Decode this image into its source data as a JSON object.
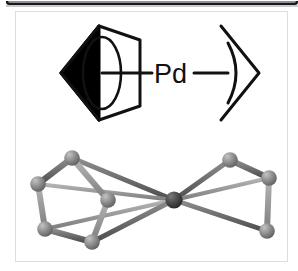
{
  "figure": {
    "caption": "",
    "background_color": "#ffffff",
    "frame_border_color": "#dedede"
  },
  "top_edge": {
    "name": "window-bottom-edge",
    "outer_color": "#17181a",
    "inner_color": "#8d9096",
    "shadow_color": "#c9cbce"
  },
  "scheme_2d": {
    "center_atom_label": "Pd",
    "left_ligand": "cyclopentadienyl-ring",
    "right_ligand": "allyl-group",
    "line_color": "#111111",
    "wedge_color": "#000000"
  },
  "model_3d": {
    "central_atom": "Pd",
    "central_atom_color": "#4a4a4a",
    "ligand_atom_color": "#8a8a8a",
    "bond_color": "#6e6e6e",
    "left_fragment": "cyclopentadienyl-ring",
    "right_fragment": "allyl-group",
    "atoms": [
      {
        "id": "Pd",
        "x": 158,
        "y": 62,
        "r": 7.5,
        "shade": "dark"
      },
      {
        "id": "Cp1",
        "x": 56,
        "y": 20,
        "r": 7.5,
        "shade": "light"
      },
      {
        "id": "Cp2",
        "x": 22,
        "y": 46,
        "r": 7.5,
        "shade": "light"
      },
      {
        "id": "Cp3",
        "x": 29,
        "y": 91,
        "r": 7.5,
        "shade": "light"
      },
      {
        "id": "Cp4",
        "x": 76,
        "y": 104,
        "r": 7.5,
        "shade": "light"
      },
      {
        "id": "Cp5",
        "x": 92,
        "y": 62,
        "r": 7.5,
        "shade": "light"
      },
      {
        "id": "Al1",
        "x": 214,
        "y": 22,
        "r": 7.5,
        "shade": "light"
      },
      {
        "id": "Al2",
        "x": 253,
        "y": 40,
        "r": 7.5,
        "shade": "light"
      },
      {
        "id": "Al3",
        "x": 251,
        "y": 93,
        "r": 7.5,
        "shade": "light"
      }
    ]
  }
}
